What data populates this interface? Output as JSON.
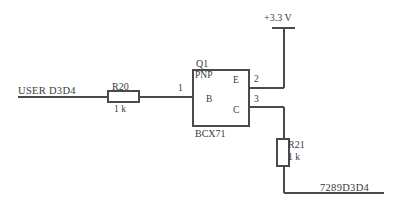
{
  "diagram": {
    "background_color": "#ffffff",
    "line_color": "#4a4a4a",
    "text_color": "#3a3a3a"
  },
  "nets": {
    "input_label": "USER D3D4",
    "output_label": "7289D3D4"
  },
  "supply": {
    "label": "+3.3 V"
  },
  "resistors": [
    {
      "ref": "R20",
      "value": "1 k",
      "orientation": "horizontal"
    },
    {
      "ref": "R21",
      "value": "1 k",
      "orientation": "vertical"
    }
  ],
  "transistor": {
    "ref": "Q1",
    "type": "PNP",
    "part": "BCX71",
    "terminals": {
      "base": "B",
      "emitter": "E",
      "collector": "C"
    }
  },
  "pins": {
    "base_pin": "1",
    "emitter_pin": "2",
    "collector_pin": "3"
  }
}
